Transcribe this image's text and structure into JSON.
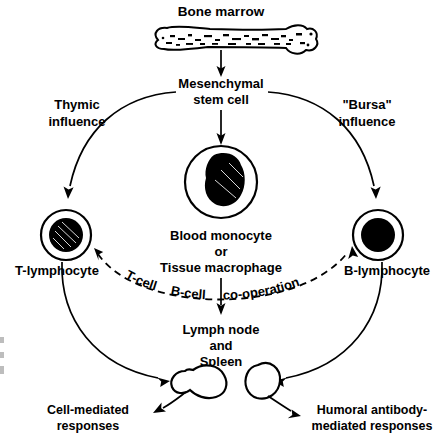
{
  "figure": {
    "type": "biology-flow-diagram"
  },
  "nodes": {
    "bone_marrow": "Bone marrow",
    "stem_cell_line1": "Mesenchymal",
    "stem_cell_line2": "stem cell",
    "monocyte_line1": "Blood monocyte",
    "monocyte_line2": "or",
    "monocyte_line3": "Tissue macrophage",
    "t_lymphocyte": "T-lymphocyte",
    "b_lymphocyte": "B-lymphocyte",
    "lymph_line1": "Lymph node",
    "lymph_line2": "and",
    "lymph_line3": "Spleen"
  },
  "influences": {
    "thymic_line1": "Thymic",
    "thymic_line2": "influence",
    "bursa_line1": "\"Bursa\"",
    "bursa_line2": "influence"
  },
  "cooperation": {
    "part1": "T-cell",
    "part2": "B-cell",
    "part3": "co-operation"
  },
  "outcomes": {
    "cell_mediated_line1": "Cell-mediated",
    "cell_mediated_line2": "responses",
    "humoral_line1": "Humoral antibody-",
    "humoral_line2": "mediated responses"
  },
  "colors": {
    "ink": "#000000",
    "paper": "#ffffff"
  }
}
